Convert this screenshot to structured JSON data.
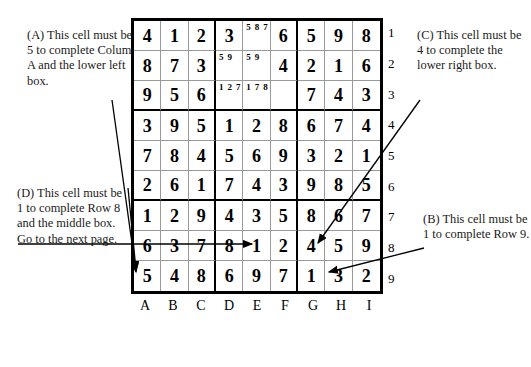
{
  "grid": {
    "column_labels": [
      "A",
      "B",
      "C",
      "D",
      "E",
      "F",
      "G",
      "H",
      "I"
    ],
    "row_labels": [
      "1",
      "2",
      "3",
      "4",
      "5",
      "6",
      "7",
      "8",
      "9"
    ],
    "rows": [
      [
        {
          "value": "4"
        },
        {
          "value": "1"
        },
        {
          "value": "2"
        },
        {
          "value": "3"
        },
        {
          "candidates": [
            "5",
            "8",
            "7"
          ]
        },
        {
          "value": "6"
        },
        {
          "value": "5"
        },
        {
          "value": "9"
        },
        {
          "value": "8"
        }
      ],
      [
        {
          "value": "8"
        },
        {
          "value": "7"
        },
        {
          "value": "3"
        },
        {
          "candidates": [
            "5",
            "9"
          ]
        },
        {
          "candidates": [
            "5",
            "9"
          ]
        },
        {
          "value": "4"
        },
        {
          "value": "2"
        },
        {
          "value": "1"
        },
        {
          "value": "6"
        }
      ],
      [
        {
          "value": "9"
        },
        {
          "value": "5"
        },
        {
          "value": "6"
        },
        {
          "candidates": [
            "1",
            "2",
            "7"
          ]
        },
        {
          "candidates": [
            "1",
            "7",
            "8"
          ]
        },
        {
          "value": ""
        },
        {
          "value": "7"
        },
        {
          "value": "4"
        },
        {
          "value": "3"
        }
      ],
      [
        {
          "value": "3"
        },
        {
          "value": "9"
        },
        {
          "value": "5"
        },
        {
          "value": "1"
        },
        {
          "value": "2"
        },
        {
          "value": "8"
        },
        {
          "value": "6"
        },
        {
          "value": "7"
        },
        {
          "value": "4"
        }
      ],
      [
        {
          "value": "7"
        },
        {
          "value": "8"
        },
        {
          "value": "4"
        },
        {
          "value": "5"
        },
        {
          "value": "6"
        },
        {
          "value": "9"
        },
        {
          "value": "3"
        },
        {
          "value": "2"
        },
        {
          "value": "1"
        }
      ],
      [
        {
          "value": "2"
        },
        {
          "value": "6"
        },
        {
          "value": "1"
        },
        {
          "value": "7"
        },
        {
          "value": "4"
        },
        {
          "value": "3"
        },
        {
          "value": "9"
        },
        {
          "value": "8"
        },
        {
          "value": "5"
        }
      ],
      [
        {
          "value": "1"
        },
        {
          "value": "2"
        },
        {
          "value": "9"
        },
        {
          "value": "4"
        },
        {
          "value": "3"
        },
        {
          "value": "5"
        },
        {
          "value": "8"
        },
        {
          "value": "6"
        },
        {
          "value": "7"
        }
      ],
      [
        {
          "value": "6"
        },
        {
          "value": "3"
        },
        {
          "value": "7"
        },
        {
          "value": "8"
        },
        {
          "value": "1"
        },
        {
          "value": "2"
        },
        {
          "value": "4"
        },
        {
          "value": "5"
        },
        {
          "value": "9"
        }
      ],
      [
        {
          "value": "5"
        },
        {
          "value": "4"
        },
        {
          "value": "8"
        },
        {
          "value": "6"
        },
        {
          "value": "9"
        },
        {
          "value": "7"
        },
        {
          "value": "1"
        },
        {
          "value": "3"
        },
        {
          "value": "2"
        }
      ]
    ]
  },
  "annotations": {
    "a": {
      "label": "(A)",
      "text": "(A) This cell must be 5 to complete Column A and the lower left box.",
      "target_cell": "A9"
    },
    "b": {
      "label": "(B)",
      "text": "(B) This cell must be 1 to complete Row 9.",
      "target_cell": "G9"
    },
    "c": {
      "label": "(C)",
      "text": "(C) This cell must be 4 to complete the lower right box.",
      "target_cell": "G8"
    },
    "d": {
      "label": "(D)",
      "text": "(D) This cell must be 1 to complete Row 8 and the middle box. Go to the next page.",
      "target_cell": "E8"
    }
  },
  "colors": {
    "ink": "#000000",
    "grid_line_thin": "#9a9a9a",
    "grid_line_thick": "#000000",
    "background": "#ffffff"
  }
}
